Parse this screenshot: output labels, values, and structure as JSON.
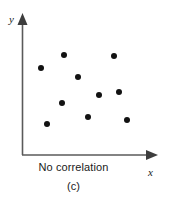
{
  "chart_data": {
    "type": "scatter",
    "title": "No correlation",
    "subtitle": "(c)",
    "xlabel": "x",
    "ylabel": "y",
    "grid": false,
    "legend": null,
    "xlim": [
      0,
      10
    ],
    "ylim": [
      0,
      10
    ],
    "axis_ticks": false,
    "point_color": "#121212",
    "axis_color": "#5a5a5a",
    "point_radius": 3.0,
    "series": [
      {
        "name": "observations",
        "x": [
          3.1,
          7.0,
          1.5,
          4.3,
          5.9,
          7.4,
          3.1,
          5.2,
          1.9,
          8.0
        ],
        "y": [
          8.0,
          7.9,
          6.8,
          6.0,
          4.6,
          4.9,
          4.1,
          2.8,
          2.2,
          2.5
        ]
      }
    ],
    "points_px": [
      {
        "cx": 64,
        "cy": 55
      },
      {
        "cx": 114,
        "cy": 56
      },
      {
        "cx": 41,
        "cy": 68
      },
      {
        "cx": 78,
        "cy": 77
      },
      {
        "cx": 119,
        "cy": 92
      },
      {
        "cx": 99,
        "cy": 95
      },
      {
        "cx": 62,
        "cy": 103
      },
      {
        "cx": 88,
        "cy": 117
      },
      {
        "cx": 127,
        "cy": 120
      },
      {
        "cx": 47,
        "cy": 124
      }
    ]
  },
  "figure": {
    "caption_main": "No correlation",
    "caption_sub": "(c)",
    "x_axis_label": "x",
    "y_axis_label": "y"
  }
}
